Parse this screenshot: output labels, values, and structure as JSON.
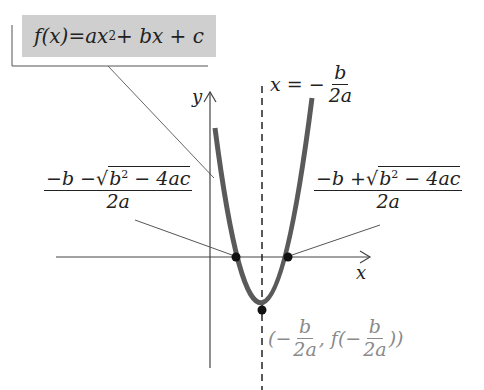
{
  "formula_box": {
    "text_fx": "f(x)",
    "eq": " = ",
    "rhs_a": "ax",
    "exp2": "2",
    "rhs_rest": " + bx + c",
    "bg": "#cfcfcf"
  },
  "axis_of_symmetry": {
    "lhs": "x = −",
    "num": "b",
    "den": "2a"
  },
  "axes": {
    "x_label": "x",
    "y_label": "y"
  },
  "root_left": {
    "num_pre": "−b −",
    "sqrt_body": "b",
    "sqrt_exp": "2",
    "sqrt_rest": " − 4ac",
    "den": "2a"
  },
  "root_right": {
    "num_pre": "−b +",
    "sqrt_body": "b",
    "sqrt_exp": "2",
    "sqrt_rest": " − 4ac",
    "den": "2a"
  },
  "vertex": {
    "open": "(−",
    "num": "b",
    "den": "2a",
    "mid": ", f(−",
    "num2": "b",
    "den2": "2a",
    "close": "))",
    "color": "#8a8a8a"
  },
  "colors": {
    "curve": "#5a5a5a",
    "axis": "#444444",
    "point": "#111111"
  }
}
